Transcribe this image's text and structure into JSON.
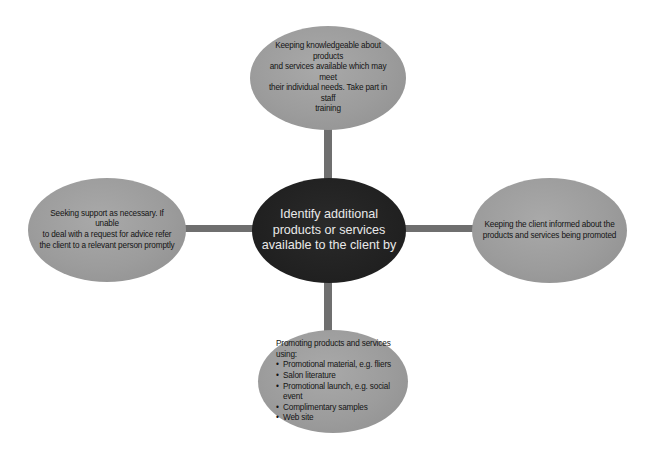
{
  "diagram": {
    "type": "mind-map",
    "colors": {
      "connector": "#6f6f6f",
      "outer_node": "#9c9c9c",
      "center_node": "#202020",
      "center_text": "#e9e9e9",
      "outer_text": "#141414"
    },
    "center": {
      "label": "Identify additional products or services available to the client by",
      "lines": [
        "Identify additional",
        "products or services",
        "available to the client by"
      ]
    },
    "top": {
      "lines": [
        "Keeping knowledgeable about products",
        "and services available which may meet",
        "their individual needs. Take part in staff",
        "training"
      ]
    },
    "left": {
      "lines": [
        "Seeking support as necessary. If unable",
        "to deal with a request for advice refer",
        "the client to a relevant person promptly"
      ]
    },
    "right": {
      "lines": [
        "Keeping the client informed about the",
        "products and services being promoted"
      ]
    },
    "bottom": {
      "lead": "Promoting products and services using:",
      "items": [
        "Promotional material, e.g. fliers",
        "Salon literature",
        "Promotional launch, e.g. social event",
        "Complimentary samples",
        "Web site"
      ]
    }
  }
}
